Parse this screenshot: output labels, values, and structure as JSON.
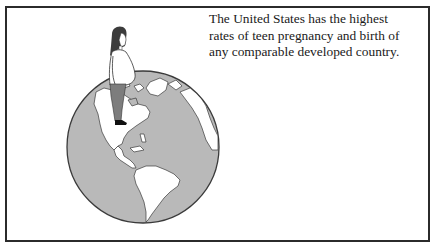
{
  "caption": {
    "lines": [
      "The United States has the highest",
      "rates of teen pregnancy and birth of",
      "any comparable developed country."
    ]
  },
  "illustration": {
    "globe_icon": "globe-americas-icon",
    "figure_icon": "pregnant-woman-icon",
    "colors": {
      "ocean": "#b9b9b9",
      "land": "#ffffff",
      "outline": "#3a3a3a",
      "pants": "#7d7d7d",
      "hair": "#3c3c3c",
      "frame": "#2b2b2b"
    }
  }
}
